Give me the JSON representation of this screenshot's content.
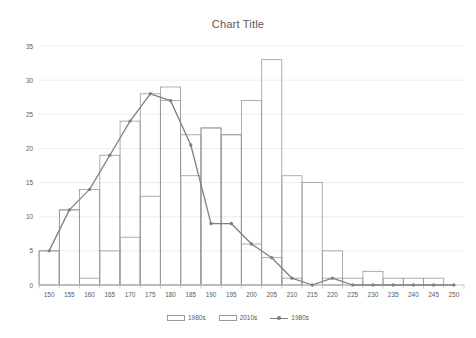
{
  "chart_data": {
    "type": "bar",
    "title": "Chart Title",
    "xlabel": "",
    "ylabel": "",
    "ylim": [
      0,
      35
    ],
    "ytick_step": 5,
    "yticks": [
      "0",
      "5",
      "10",
      "15",
      "20",
      "25",
      "30",
      "35"
    ],
    "grid": true,
    "legend_position": "bottom",
    "categories": [
      "150",
      "155",
      "160",
      "165",
      "170",
      "175",
      "180",
      "185",
      "190",
      "195",
      "200",
      "205",
      "210",
      "215",
      "220",
      "225",
      "230",
      "235",
      "240",
      "245",
      "250"
    ],
    "series": [
      {
        "name": "1980s",
        "kind": "bar",
        "values": [
          5,
          11,
          1,
          5,
          7,
          13,
          27,
          16,
          23,
          22,
          6,
          4,
          1,
          0,
          1,
          0,
          0,
          0,
          0,
          0,
          0
        ]
      },
      {
        "name": "2010s",
        "kind": "bar",
        "values": [
          5,
          11,
          14,
          19,
          24,
          28,
          29,
          22,
          23,
          22,
          27,
          33,
          16,
          15,
          5,
          1,
          2,
          1,
          1,
          1,
          0
        ]
      },
      {
        "name": "1980s",
        "kind": "line",
        "values": [
          5,
          11,
          14,
          19,
          24,
          28,
          27,
          20.5,
          9,
          9,
          6,
          4,
          1,
          0,
          1,
          0,
          0,
          0,
          0,
          0,
          0
        ]
      }
    ]
  },
  "legend": {
    "items": [
      {
        "label": "1980s",
        "marker": "bar-swatch"
      },
      {
        "label": "2010s",
        "marker": "bar-swatch"
      },
      {
        "label": "1980s",
        "marker": "line-marker-swatch"
      }
    ]
  },
  "colors": {
    "series_outline": "#9a9a9a",
    "line_series": "#808080",
    "gridline": "#e8e8e8",
    "axis_text": "#595959",
    "background": "#ffffff"
  }
}
